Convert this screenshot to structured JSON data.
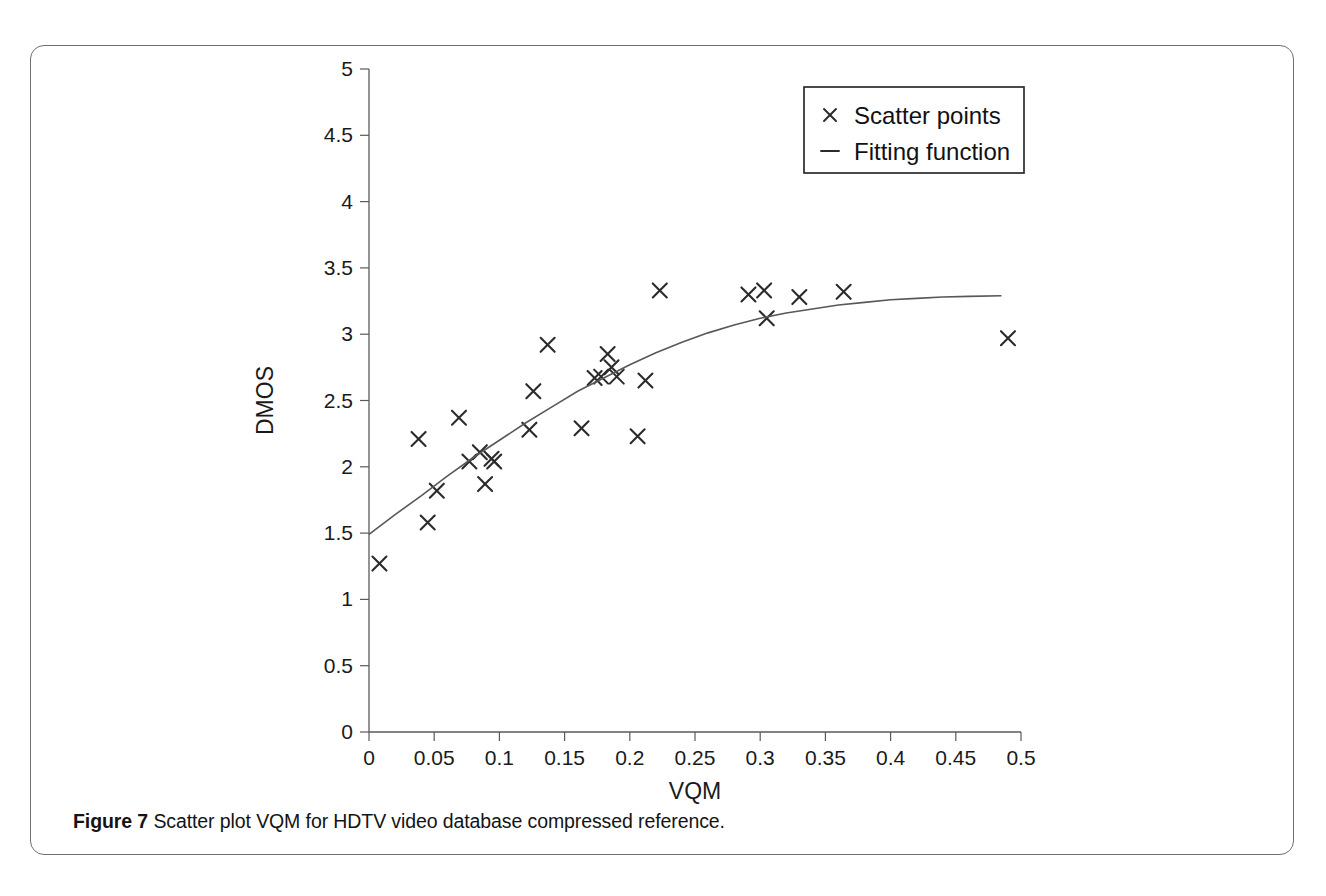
{
  "figure": {
    "caption_label": "Figure 7",
    "caption_text": "Scatter plot VQM for HDTV video database compressed reference."
  },
  "legend": {
    "position": "top-right",
    "entries": [
      {
        "label": "Scatter points",
        "marker": "x",
        "icon": "cross-marker-icon"
      },
      {
        "label": "Fitting function",
        "marker": "line",
        "icon": "line-marker-icon"
      }
    ]
  },
  "chart_data": {
    "type": "scatter",
    "title": "",
    "xlabel": "VQM",
    "ylabel": "DMOS",
    "xlim": [
      0,
      0.5
    ],
    "ylim": [
      0,
      5
    ],
    "grid": false,
    "xticks": [
      0,
      0.05,
      0.1,
      0.15,
      0.2,
      0.25,
      0.3,
      0.35,
      0.4,
      0.45,
      0.5
    ],
    "xtick_labels": [
      "0",
      "0.05",
      "0.1",
      "0.15",
      "0.2",
      "0.25",
      "0.3",
      "0.35",
      "0.4",
      "0.45",
      "0.5"
    ],
    "yticks": [
      0,
      0.5,
      1,
      1.5,
      2,
      2.5,
      3,
      3.5,
      4,
      4.5,
      5
    ],
    "ytick_labels": [
      "0",
      "0.5",
      "1",
      "1.5",
      "2",
      "2.5",
      "3",
      "3.5",
      "4",
      "4.5",
      "5"
    ],
    "legend_position": "upper right",
    "series": [
      {
        "name": "Scatter points",
        "type": "scatter",
        "marker": "x",
        "color": "#2b2b2b",
        "points": [
          {
            "x": 0.008,
            "y": 1.27
          },
          {
            "x": 0.038,
            "y": 2.21
          },
          {
            "x": 0.045,
            "y": 1.58
          },
          {
            "x": 0.052,
            "y": 1.82
          },
          {
            "x": 0.069,
            "y": 2.37
          },
          {
            "x": 0.077,
            "y": 2.04
          },
          {
            "x": 0.085,
            "y": 2.11
          },
          {
            "x": 0.089,
            "y": 1.87
          },
          {
            "x": 0.094,
            "y": 2.06
          },
          {
            "x": 0.096,
            "y": 2.04
          },
          {
            "x": 0.123,
            "y": 2.28
          },
          {
            "x": 0.126,
            "y": 2.57
          },
          {
            "x": 0.137,
            "y": 2.92
          },
          {
            "x": 0.163,
            "y": 2.29
          },
          {
            "x": 0.173,
            "y": 2.67
          },
          {
            "x": 0.178,
            "y": 2.68
          },
          {
            "x": 0.183,
            "y": 2.85
          },
          {
            "x": 0.186,
            "y": 2.75
          },
          {
            "x": 0.19,
            "y": 2.68
          },
          {
            "x": 0.206,
            "y": 2.23
          },
          {
            "x": 0.212,
            "y": 2.65
          },
          {
            "x": 0.223,
            "y": 3.33
          },
          {
            "x": 0.291,
            "y": 3.3
          },
          {
            "x": 0.303,
            "y": 3.33
          },
          {
            "x": 0.305,
            "y": 3.12
          },
          {
            "x": 0.33,
            "y": 3.28
          },
          {
            "x": 0.364,
            "y": 3.32
          },
          {
            "x": 0.49,
            "y": 2.97
          }
        ]
      },
      {
        "name": "Fitting function",
        "type": "line",
        "color": "#585858",
        "points": [
          {
            "x": 0.0,
            "y": 1.49
          },
          {
            "x": 0.02,
            "y": 1.64
          },
          {
            "x": 0.04,
            "y": 1.78
          },
          {
            "x": 0.06,
            "y": 1.93
          },
          {
            "x": 0.08,
            "y": 2.07
          },
          {
            "x": 0.1,
            "y": 2.2
          },
          {
            "x": 0.12,
            "y": 2.33
          },
          {
            "x": 0.14,
            "y": 2.45
          },
          {
            "x": 0.16,
            "y": 2.57
          },
          {
            "x": 0.18,
            "y": 2.67
          },
          {
            "x": 0.2,
            "y": 2.77
          },
          {
            "x": 0.22,
            "y": 2.86
          },
          {
            "x": 0.24,
            "y": 2.94
          },
          {
            "x": 0.26,
            "y": 3.01
          },
          {
            "x": 0.28,
            "y": 3.07
          },
          {
            "x": 0.3,
            "y": 3.12
          },
          {
            "x": 0.32,
            "y": 3.16
          },
          {
            "x": 0.34,
            "y": 3.19
          },
          {
            "x": 0.36,
            "y": 3.22
          },
          {
            "x": 0.38,
            "y": 3.24
          },
          {
            "x": 0.4,
            "y": 3.26
          },
          {
            "x": 0.42,
            "y": 3.27
          },
          {
            "x": 0.44,
            "y": 3.28
          },
          {
            "x": 0.46,
            "y": 3.285
          },
          {
            "x": 0.485,
            "y": 3.29
          }
        ]
      }
    ]
  }
}
